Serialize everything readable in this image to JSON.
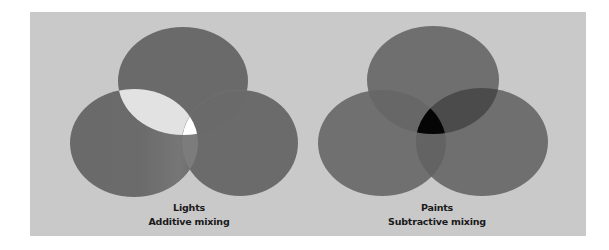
{
  "panel": {
    "background": "#c9c9c9"
  },
  "diagrams": [
    {
      "id": "additive",
      "title": "Lights",
      "subtitle": "Additive mixing",
      "ellipses": {
        "top": {
          "cx": 183,
          "cy": 81,
          "rx": 65,
          "ry": 54
        },
        "left": {
          "cx": 134,
          "cy": 143,
          "rx": 64,
          "ry": 54
        },
        "right": {
          "cx": 240,
          "cy": 143,
          "rx": 58,
          "ry": 53
        }
      },
      "colors": {
        "base": "#6b6b6b",
        "top_left_overlap": "#e2e2e2",
        "top_right_overlap": "#6a6a6a",
        "left_right_overlap": "#7c7c7c",
        "center": "#ffffff"
      }
    },
    {
      "id": "subtractive",
      "title": "Paints",
      "subtitle": "Subtractive mixing",
      "ellipses": {
        "top": {
          "cx": 433,
          "cy": 80,
          "rx": 66,
          "ry": 54
        },
        "left": {
          "cx": 382,
          "cy": 143,
          "rx": 64,
          "ry": 53
        },
        "right": {
          "cx": 482,
          "cy": 142,
          "rx": 66,
          "ry": 54
        }
      },
      "colors": {
        "base": "#707070",
        "top_left_overlap": "#676767",
        "top_right_overlap": "#4b4b4b",
        "left_right_overlap": "#636363",
        "center": "#050505"
      }
    }
  ]
}
